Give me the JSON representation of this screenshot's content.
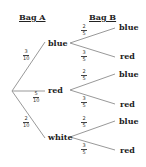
{
  "headers": {
    "bag_a": "Bag A",
    "bag_b": "Bag B"
  },
  "bag_a": [
    {
      "label": "blue",
      "num": "3",
      "den": "10"
    },
    {
      "label": "red",
      "num": "5",
      "den": "10"
    },
    {
      "label": "white",
      "num": "2",
      "den": "10"
    }
  ],
  "bag_b": [
    {
      "label": "blue",
      "num": "2",
      "den": "5"
    },
    {
      "label": "red",
      "num": "3",
      "den": "5"
    },
    {
      "label": "blue",
      "num": "2",
      "den": "5"
    },
    {
      "label": "red",
      "num": "3",
      "den": "5"
    },
    {
      "label": "blue",
      "num": "2",
      "den": "5"
    },
    {
      "label": "red",
      "num": "3",
      "den": "5"
    }
  ],
  "colors": {
    "line": "#999999",
    "text": "#222222"
  }
}
